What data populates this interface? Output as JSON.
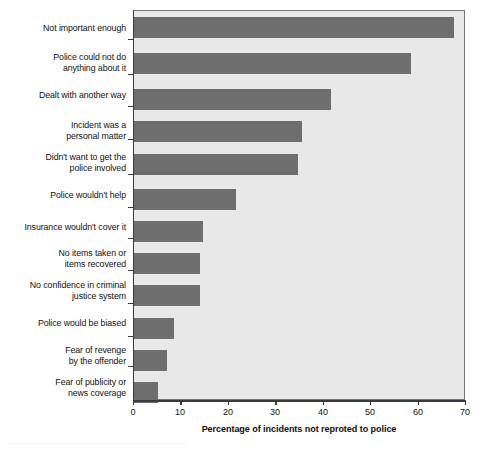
{
  "chart_data": {
    "type": "bar",
    "orientation": "horizontal",
    "title": "",
    "xlabel": "Percentage of incidents not reproted to police",
    "ylabel": "",
    "xlim": [
      0,
      70
    ],
    "xticks": [
      0,
      10,
      20,
      30,
      40,
      50,
      60,
      70
    ],
    "xtick_labels": [
      "0",
      "10",
      "20",
      "30",
      "40",
      "50",
      "60",
      "70"
    ],
    "grid": false,
    "legend": null,
    "bar_color": "#6e6e6e",
    "plot_background": "#e8e8e8",
    "categories": [
      "Not important enough",
      "Police could not do\nanything about it",
      "Dealt with another way",
      "Incident was a\npersonal matter",
      "Didn't want to get the\npolice involved",
      "Police wouldn't help",
      "Insurance wouldn't cover it",
      "No items taken or\nitems recovered",
      "No confidence in criminal\njustice system",
      "Police would be biased",
      "Fear of revenge\nby the offender",
      "Fear of publicity or\nnews coverage"
    ],
    "values": [
      67.5,
      58.5,
      41.5,
      35.5,
      34.5,
      21.5,
      14.5,
      14,
      14,
      8.5,
      7,
      5
    ]
  },
  "footnote": {
    "text": "................................................................................................................................................................"
  }
}
